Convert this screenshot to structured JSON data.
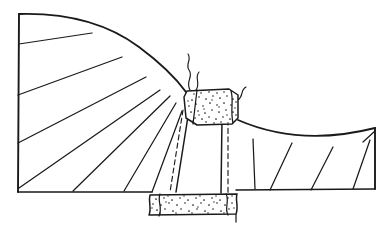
{
  "figure": {
    "background_color": "#ffffff",
    "ink_color": "#1a1a1a",
    "width": 387,
    "height": 235
  },
  "chart_data": {
    "type": "diagram",
    "xlabel": "",
    "ylabel": "",
    "grid": false,
    "legend": "none",
    "xlim": [
      0,
      387
    ],
    "ylim": [
      0,
      235
    ],
    "elements": [
      {
        "name": "ground-surface-left-limb",
        "kind": "curve",
        "role": "erosional-topographic-surface",
        "path": "M 19 14 Q 92 12 139 47 Q 170 70 186 92"
      },
      {
        "name": "ground-surface-right-limb",
        "kind": "curve",
        "role": "erosional-topographic-surface",
        "path": "M 238 120 Q 300 147 375 128"
      },
      {
        "name": "left-block-west-edge",
        "kind": "line",
        "role": "section-boundary",
        "x1": 19,
        "y1": 14,
        "x2": 18,
        "y2": 192
      },
      {
        "name": "left-block-baseline",
        "kind": "line",
        "role": "section-base",
        "x1": 18,
        "y1": 192,
        "x2": 152,
        "y2": 192
      },
      {
        "name": "right-block-baseline",
        "kind": "line",
        "role": "section-base",
        "x1": 236,
        "y1": 190,
        "x2": 375,
        "y2": 189
      },
      {
        "name": "right-block-east-edge",
        "kind": "line",
        "role": "section-boundary",
        "x1": 375,
        "y1": 128,
        "x2": 375,
        "y2": 189
      }
    ],
    "bedding_left_limb": [
      {
        "name": "bedding-left-1",
        "x1": 19,
        "y1": 44,
        "x2": 92,
        "y2": 33
      },
      {
        "name": "bedding-left-2",
        "x1": 18,
        "y1": 95,
        "x2": 122,
        "y2": 57
      },
      {
        "name": "bedding-left-3",
        "x1": 18,
        "y1": 143,
        "x2": 146,
        "y2": 77
      },
      {
        "name": "bedding-left-4",
        "x1": 19,
        "y1": 188,
        "x2": 160,
        "y2": 90
      },
      {
        "name": "bedding-left-5",
        "x1": 73,
        "y1": 191,
        "x2": 170,
        "y2": 96
      },
      {
        "name": "bedding-left-6",
        "x1": 124,
        "y1": 191,
        "x2": 176,
        "y2": 103
      },
      {
        "name": "bedding-left-7",
        "x1": 152,
        "y1": 192,
        "x2": 182,
        "y2": 111
      }
    ],
    "bedding_right_limb": [
      {
        "name": "bedding-right-1",
        "x1": 255,
        "y1": 189,
        "x2": 253,
        "y2": 139
      },
      {
        "name": "bedding-right-2",
        "x1": 270,
        "y1": 190,
        "x2": 292,
        "y2": 143
      },
      {
        "name": "bedding-right-3",
        "x1": 311,
        "y1": 190,
        "x2": 333,
        "y2": 147
      },
      {
        "name": "bedding-right-4",
        "x1": 353,
        "y1": 189,
        "x2": 370,
        "y2": 140
      },
      {
        "name": "bedding-right-5",
        "x1": 375,
        "y1": 131,
        "x2": 363,
        "y2": 142
      }
    ],
    "dike_traces": [
      {
        "name": "dike-west-wall-solid",
        "x1": 189,
        "y1": 110,
        "x2": 176,
        "y2": 192
      },
      {
        "name": "dike-west-wall-dashed",
        "x1": 183,
        "y1": 110,
        "x2": 170,
        "y2": 192
      },
      {
        "name": "dike-east-wall-solid",
        "x1": 222,
        "y1": 118,
        "x2": 221,
        "y2": 193
      },
      {
        "name": "dike-east-wall-dashed",
        "x1": 228,
        "y1": 120,
        "x2": 228,
        "y2": 193
      }
    ],
    "stipple_bodies": [
      {
        "name": "crest-intrusive-body",
        "role": "stippled-intrusive-plug",
        "path": "M 184 96 L 186 91 L 230 89 L 238 94 L 238 119 L 233 124 L 196 124 L 186 118 Z",
        "dot_count": 118
      },
      {
        "name": "basal-intrusive-body",
        "role": "stippled-sill",
        "path": "M 149 194 L 236 193 L 238 214 L 152 216 Z",
        "dot_count": 150
      }
    ],
    "squiggle": {
      "name": "vent-squiggle",
      "role": "eruptive-vent-trace",
      "path": "M 190 90 C 186 80 194 76 190 70 C 187 65 192 60 189 55",
      "secondary_path": "M 194 90 C 199 82 193 78 197 72"
    }
  }
}
